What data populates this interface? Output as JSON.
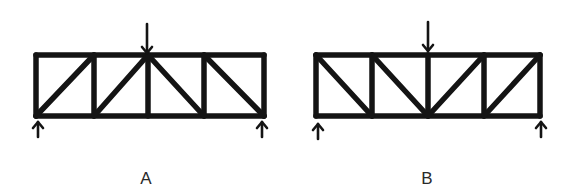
{
  "figure": {
    "colors": {
      "ink": "#141414",
      "background": "#ffffff",
      "label": "#2a2a2a"
    }
  },
  "trusses": [
    {
      "id": "A",
      "label": "A",
      "label_pos": [
        146,
        170
      ],
      "top_y": 55,
      "bottom_y": 116,
      "node_x": [
        36,
        94,
        148,
        204,
        264
      ],
      "diagonals": [
        {
          "from": [
            36,
            116
          ],
          "to": [
            94,
            55
          ]
        },
        {
          "from": [
            94,
            116
          ],
          "to": [
            148,
            55
          ]
        },
        {
          "from": [
            148,
            55
          ],
          "to": [
            204,
            116
          ]
        },
        {
          "from": [
            204,
            55
          ],
          "to": [
            264,
            116
          ]
        }
      ],
      "load_arrow": {
        "x": 147,
        "y_start": 24,
        "y_end": 53,
        "direction": "down"
      },
      "support_arrows": [
        {
          "x": 38,
          "y_start": 137,
          "y_end": 122,
          "direction": "up"
        },
        {
          "x": 262,
          "y_start": 137,
          "y_end": 122,
          "direction": "up"
        }
      ]
    },
    {
      "id": "B",
      "label": "B",
      "label_pos": [
        427,
        170
      ],
      "top_y": 55,
      "bottom_y": 116,
      "node_x": [
        316,
        372,
        428,
        484,
        540
      ],
      "diagonals": [
        {
          "from": [
            316,
            55
          ],
          "to": [
            372,
            116
          ]
        },
        {
          "from": [
            372,
            55
          ],
          "to": [
            428,
            116
          ]
        },
        {
          "from": [
            428,
            116
          ],
          "to": [
            484,
            55
          ]
        },
        {
          "from": [
            484,
            116
          ],
          "to": [
            540,
            55
          ]
        }
      ],
      "load_arrow": {
        "x": 428,
        "y_start": 22,
        "y_end": 51,
        "direction": "down"
      },
      "support_arrows": [
        {
          "x": 318,
          "y_start": 139,
          "y_end": 124,
          "direction": "up"
        },
        {
          "x": 541,
          "y_start": 137,
          "y_end": 122,
          "direction": "up"
        }
      ]
    }
  ]
}
